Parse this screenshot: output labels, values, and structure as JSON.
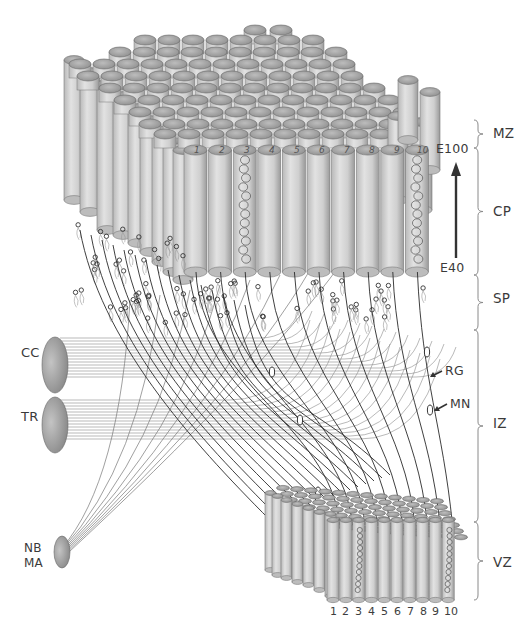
{
  "figure": {
    "type": "schematic diagram"
  },
  "zones": [
    {
      "id": "mz",
      "label": "MZ",
      "top": 120,
      "bottom": 148,
      "label_y": 134
    },
    {
      "id": "cp",
      "label": "CP",
      "top": 148,
      "bottom": 275,
      "label_y": 212
    },
    {
      "id": "sp",
      "label": "SP",
      "top": 275,
      "bottom": 330,
      "label_y": 299
    },
    {
      "id": "iz",
      "label": "IZ",
      "top": 330,
      "bottom": 522,
      "label_y": 424
    },
    {
      "id": "vz",
      "label": "VZ",
      "top": 522,
      "bottom": 600,
      "label_y": 563
    }
  ],
  "time_axis": {
    "start_label": "E40",
    "end_label": "E100",
    "direction": "upward"
  },
  "afferents": [
    {
      "id": "cc",
      "label": "CC",
      "cx": 55,
      "cy": 365
    },
    {
      "id": "tr",
      "label": "TR",
      "cx": 55,
      "cy": 425
    },
    {
      "id": "nbma",
      "label_line1": "NB",
      "label_line2": "MA",
      "cx": 62,
      "cy": 552
    }
  ],
  "annotations": [
    {
      "id": "rg",
      "label": "RG",
      "meaning_arrow_to": "radial glial fiber"
    },
    {
      "id": "mn",
      "label": "MN",
      "meaning_arrow_to": "migrating neuron"
    }
  ],
  "cp_column_numbers": [
    "1",
    "2",
    "3",
    "4",
    "5",
    "6",
    "7",
    "8",
    "9",
    "10"
  ],
  "vz_column_numbers": [
    "1",
    "2",
    "3",
    "4",
    "5",
    "6",
    "7",
    "8",
    "9",
    "10"
  ],
  "highlighted_columns": [
    "3",
    "10"
  ],
  "colors": {
    "column_fill": "#cfcfcf",
    "column_shade": "#9a9a9a",
    "column_top": "#a8a8a8",
    "fiber": "#2a2a2a",
    "afferent_fiber": "#8a8a8a",
    "text": "#3a3a3a"
  }
}
